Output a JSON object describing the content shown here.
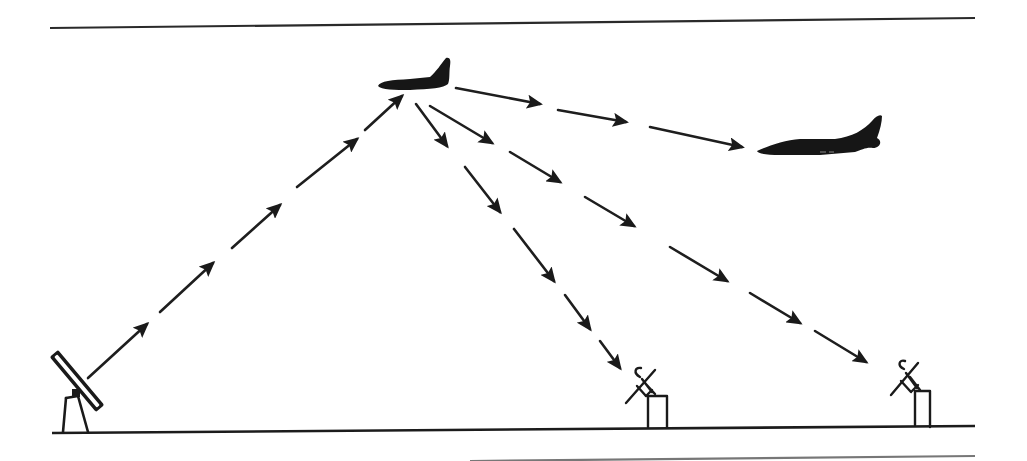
{
  "diagram": {
    "colors": {
      "ink": "#1a1a1a",
      "background": "#ffffff"
    },
    "nodes": [
      {
        "id": "transmitter",
        "type": "ground-antenna-panel",
        "x": 78,
        "y": 410
      },
      {
        "id": "relay-aircraft",
        "type": "aircraft",
        "x": 415,
        "y": 75
      },
      {
        "id": "receiver-aircraft",
        "type": "aircraft",
        "x": 820,
        "y": 140
      },
      {
        "id": "receiver-dish-1",
        "type": "ground-dish",
        "x": 650,
        "y": 400
      },
      {
        "id": "receiver-dish-2",
        "type": "ground-dish",
        "x": 918,
        "y": 400
      }
    ],
    "links": [
      {
        "from": "transmitter",
        "to": "relay-aircraft",
        "style": "dashed-arrows",
        "segments": 5
      },
      {
        "from": "relay-aircraft",
        "to": "receiver-aircraft",
        "style": "dashed-arrows",
        "segments": 3
      },
      {
        "from": "relay-aircraft",
        "to": "receiver-dish-1",
        "style": "dashed-arrows",
        "segments": 5
      },
      {
        "from": "relay-aircraft",
        "to": "receiver-dish-2",
        "style": "dashed-arrows",
        "segments": 6
      }
    ],
    "arrows": {
      "uplink": [
        [
          88,
          378,
          147,
          324
        ],
        [
          160,
          312,
          213,
          263
        ],
        [
          232,
          248,
          280,
          205
        ],
        [
          297,
          187,
          357,
          139
        ],
        [
          365,
          130,
          402,
          96
        ]
      ],
      "to_aircraft": [
        [
          456,
          88,
          540,
          104
        ],
        [
          558,
          110,
          626,
          122
        ],
        [
          650,
          127,
          742,
          147
        ]
      ],
      "to_dish_1": [
        [
          416,
          104,
          447,
          146
        ],
        [
          465,
          167,
          500,
          212
        ],
        [
          514,
          229,
          554,
          281
        ],
        [
          565,
          295,
          590,
          329
        ],
        [
          600,
          341,
          620,
          368
        ]
      ],
      "to_dish_2": [
        [
          430,
          106,
          492,
          143
        ],
        [
          510,
          152,
          560,
          182
        ],
        [
          585,
          197,
          634,
          226
        ],
        [
          670,
          247,
          727,
          281
        ],
        [
          750,
          293,
          800,
          323
        ],
        [
          815,
          331,
          866,
          362
        ]
      ]
    },
    "lines": {
      "top_rule": [
        50,
        28,
        975,
        18
      ],
      "ground": [
        52,
        433,
        975,
        426
      ],
      "bottom_rule": [
        470,
        462,
        975,
        456
      ]
    }
  }
}
